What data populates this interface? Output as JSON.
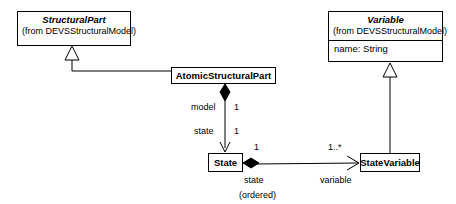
{
  "diagram": {
    "type": "uml-class-diagram",
    "classes": [
      {
        "id": "structural-part",
        "name": "StructuralPart",
        "stereotype_from": "(from DEVSStructuralModel)",
        "abstract": true,
        "attributes": []
      },
      {
        "id": "variable",
        "name": "Variable",
        "stereotype_from": "(from DEVSStructuralModel)",
        "abstract": true,
        "attributes": [
          "name: String"
        ]
      },
      {
        "id": "atomic-structural-part",
        "name": "AtomicStructuralPart",
        "stereotype_from": "",
        "abstract": false,
        "attributes": []
      },
      {
        "id": "state",
        "name": "State",
        "stereotype_from": "",
        "abstract": false,
        "attributes": []
      },
      {
        "id": "state-variable",
        "name": "StateVariable",
        "stereotype_from": "",
        "abstract": false,
        "attributes": []
      }
    ],
    "relationships": [
      {
        "id": "gen-atomic-structuralpart",
        "kind": "generalization",
        "from": "AtomicStructuralPart",
        "to": "StructuralPart"
      },
      {
        "id": "gen-statevariable-variable",
        "kind": "generalization",
        "from": "StateVariable",
        "to": "Variable"
      },
      {
        "id": "assoc-atomic-state",
        "kind": "composition",
        "from": "AtomicStructuralPart",
        "to": "State",
        "source_role": "model",
        "source_multiplicity": "1",
        "target_role": "state",
        "target_multiplicity": "1"
      },
      {
        "id": "assoc-state-statevariable",
        "kind": "composition",
        "from": "State",
        "to": "StateVariable",
        "source_multiplicity": "1",
        "target_multiplicity": "1..*",
        "target_role": "variable",
        "source_role": "state",
        "constraint": "(ordered)"
      }
    ],
    "labels": {
      "model": "model",
      "state_upper": "state",
      "state_lower": "state",
      "ordered": "(ordered)",
      "variable": "variable",
      "one_a": "1",
      "one_b": "1",
      "one_c": "1",
      "one_star": "1..*"
    },
    "colors": {
      "line": "#000000",
      "fill": "#ffffff",
      "text": "#000000"
    }
  }
}
